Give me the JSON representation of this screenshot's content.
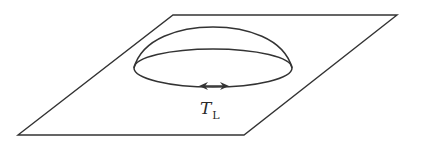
{
  "diagram": {
    "type": "dome-on-plane",
    "stroke_color": "#333333",
    "background": "#ffffff",
    "plane": {
      "points": [
        [
          173,
          15
        ],
        [
          397,
          15
        ],
        [
          244,
          135
        ],
        [
          18,
          135
        ]
      ]
    },
    "dome": {
      "base_center": [
        213,
        68
      ],
      "rx": 79,
      "ry": 19,
      "top_y": 27
    },
    "arrow": {
      "y": 86,
      "x_left": 199,
      "x_right": 229,
      "style": "double-headed"
    },
    "label": {
      "main": "T",
      "subscript": "L"
    }
  }
}
